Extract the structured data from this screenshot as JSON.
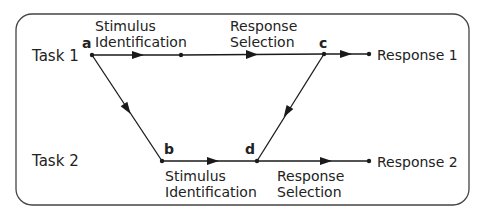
{
  "diagram": {
    "tasks": [
      {
        "label": "Task 1"
      },
      {
        "label": "Task 2"
      }
    ],
    "points": {
      "a": "a",
      "b": "b",
      "c": "c",
      "d": "d"
    },
    "stages": {
      "task1_stimulus": {
        "line1": "Stimulus",
        "line2": "Identification"
      },
      "task1_response": {
        "line1": "Response",
        "line2": "Selection"
      },
      "task2_stimulus": {
        "line1": "Stimulus",
        "line2": "Identification"
      },
      "task2_response": {
        "line1": "Response",
        "line2": "Selection"
      }
    },
    "responses": [
      {
        "label": "Response 1"
      },
      {
        "label": "Response 2"
      }
    ],
    "colors": {
      "line": "#1a1a1a",
      "border": "#444444"
    }
  }
}
